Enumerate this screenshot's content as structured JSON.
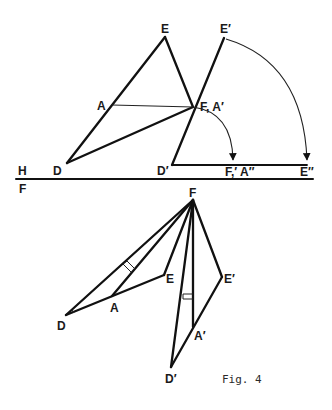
{
  "figure": {
    "caption": "Fig. 4",
    "ground_line": {
      "label_above": "H",
      "label_below": "F",
      "x1": 16,
      "x2": 313,
      "y": 179
    },
    "top_view": {
      "points": {
        "E": [
          165,
          37
        ],
        "A": [
          112,
          105
        ],
        "F": [
          193,
          107
        ],
        "D": [
          67,
          163
        ],
        "E1": [
          224,
          38
        ],
        "D1": [
          172,
          165
        ],
        "FA2": [
          233,
          165
        ],
        "E2": [
          307,
          165
        ]
      },
      "labels": {
        "E": "E",
        "A": "A",
        "F": "F, A′",
        "D": "D",
        "E1": "E′",
        "D1": "D′",
        "FA2": "F,′ A″",
        "E2": "E″"
      }
    },
    "bottom_view": {
      "points": {
        "F": [
          193,
          200
        ],
        "D": [
          66,
          315
        ],
        "A": [
          112,
          296
        ],
        "E": [
          164,
          275
        ],
        "E1": [
          222,
          277
        ],
        "A1": [
          193,
          327
        ],
        "D1": [
          171,
          367
        ]
      },
      "labels": {
        "F": "F",
        "D": "D",
        "A": "A",
        "E": "E",
        "E1": "E′",
        "A1": "A′",
        "D1": "D′"
      }
    },
    "colors": {
      "line": "#111111",
      "background": "#ffffff"
    }
  }
}
